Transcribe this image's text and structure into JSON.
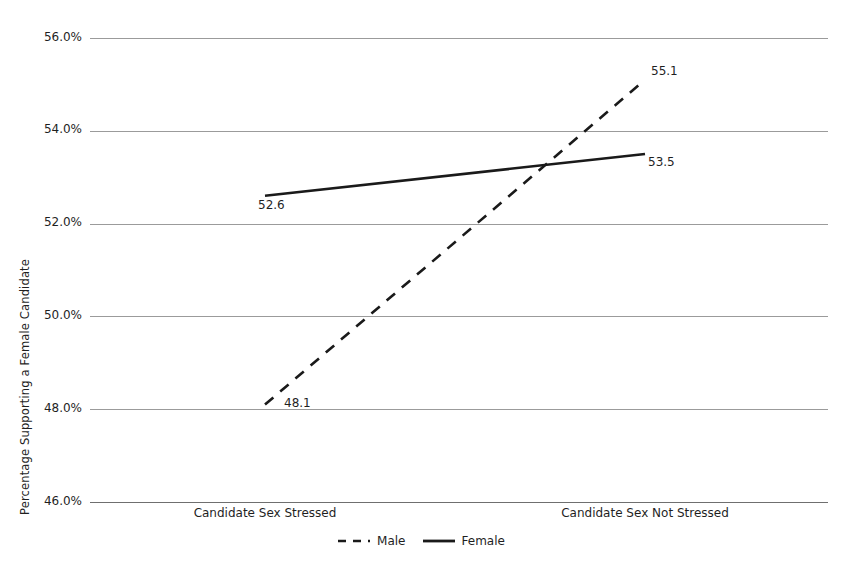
{
  "chart_data": {
    "type": "line",
    "title": "",
    "subtitle": "",
    "xlabel": "",
    "ylabel": "Percentage Supporting a Female Candidate",
    "categories": [
      "Candidate Sex Stressed",
      "Candidate Sex Not Stressed"
    ],
    "ylim": [
      46.0,
      56.0
    ],
    "ytick_values": [
      56.0,
      54.0,
      52.0,
      50.0,
      48.0,
      46.0
    ],
    "ytick_labels": [
      "56.0%",
      "54.0%",
      "52.0%",
      "50.0%",
      "48.0%",
      "46.0%"
    ],
    "grid": true,
    "legend_position": "bottom-center",
    "series": [
      {
        "name": "Male",
        "style": "dashed",
        "color": "#1a1a1a",
        "values": [
          48.1,
          55.1
        ],
        "point_labels": [
          "48.1",
          "55.1"
        ]
      },
      {
        "name": "Female",
        "style": "solid",
        "color": "#1a1a1a",
        "values": [
          52.6,
          53.5
        ],
        "point_labels": [
          "52.6",
          "53.5"
        ]
      }
    ]
  },
  "axis": {
    "y_title": "Percentage Supporting a Female Candidate",
    "ticks": [
      {
        "label": "56.0%"
      },
      {
        "label": "54.0%"
      },
      {
        "label": "52.0%"
      },
      {
        "label": "50.0%"
      },
      {
        "label": "48.0%"
      },
      {
        "label": "46.0%"
      }
    ],
    "categories": [
      {
        "label": "Candidate Sex Stressed"
      },
      {
        "label": "Candidate Sex Not Stressed"
      }
    ]
  },
  "labels": {
    "male_left": "48.1",
    "male_right": "55.1",
    "female_left": "52.6",
    "female_right": "53.5"
  },
  "legend": {
    "entries": [
      {
        "label": "Male"
      },
      {
        "label": "Female"
      }
    ]
  },
  "colors": {
    "line": "#1a1a1a",
    "grid": "#9b9b9b",
    "baseline": "#6f6f6f",
    "text": "#1f1f1f",
    "background": "#ffffff"
  }
}
